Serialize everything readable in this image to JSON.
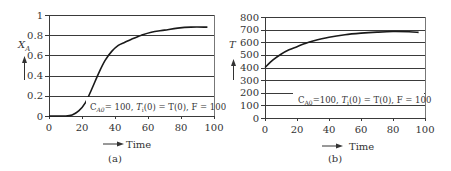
{
  "chart_data": [
    {
      "type": "line",
      "panel_label": "(a)",
      "title": "",
      "xlabel": "Time",
      "ylabel": "X_A",
      "xlim": [
        0,
        100
      ],
      "ylim": [
        0,
        1
      ],
      "x_ticks": [
        "0",
        "20",
        "40",
        "60",
        "80",
        "100"
      ],
      "y_ticks": [
        "0",
        "0.2",
        "0.4",
        "0.6",
        "0.8",
        "1"
      ],
      "grid": "horizontal",
      "annotation": "C_A0 = 100, T_i(0) = T(0), F = 100",
      "series": [
        {
          "name": "X_A",
          "x": [
            0,
            10,
            14,
            18,
            22,
            26,
            30,
            34,
            38,
            42,
            46,
            50,
            56,
            62,
            70,
            78,
            86,
            96
          ],
          "y": [
            0,
            0,
            0.01,
            0.05,
            0.13,
            0.27,
            0.42,
            0.55,
            0.64,
            0.7,
            0.73,
            0.76,
            0.8,
            0.83,
            0.85,
            0.87,
            0.88,
            0.88
          ]
        }
      ]
    },
    {
      "type": "line",
      "panel_label": "(b)",
      "title": "",
      "xlabel": "Time",
      "ylabel": "T",
      "xlim": [
        0,
        100
      ],
      "ylim": [
        0,
        800
      ],
      "x_ticks": [
        "0",
        "20",
        "40",
        "60",
        "80",
        "100"
      ],
      "y_ticks": [
        "0",
        "100",
        "200",
        "300",
        "400",
        "500",
        "600",
        "700",
        "800"
      ],
      "grid": "horizontal",
      "annotation": "C_A0 = 100, T_i(0) = T(0), F = 100",
      "series": [
        {
          "name": "T",
          "x": [
            0,
            5,
            10,
            15,
            20,
            25,
            30,
            40,
            50,
            60,
            70,
            80,
            90,
            96
          ],
          "y": [
            400,
            460,
            505,
            540,
            565,
            590,
            610,
            640,
            660,
            672,
            680,
            685,
            683,
            678
          ]
        }
      ]
    }
  ],
  "panels": {
    "a": {
      "label": "(a)",
      "xlabel": "Time",
      "ylabel_main": "X",
      "ylabel_sub": "A",
      "annotation": {
        "c": "C",
        "c_sub": "A0",
        "c_val": "= 100, ",
        "ti": "T",
        "ti_sub": "i",
        "rest": "(0) = T(0), F = 100"
      }
    },
    "b": {
      "label": "(b)",
      "xlabel": "Time",
      "ylabel_main": "T",
      "annotation": {
        "c": "C",
        "c_sub": "A0",
        "c_val": "=100,  ",
        "ti": "T",
        "ti_sub": "i",
        "rest": "(0) = T(0),  F = 100"
      }
    }
  }
}
